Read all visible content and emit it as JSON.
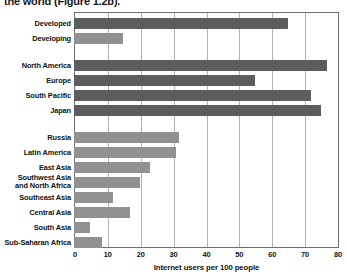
{
  "caption": {
    "text": "the world (Figure 1.2b)."
  },
  "chart_data": {
    "type": "bar",
    "orientation": "horizontal",
    "title": "",
    "subtitle": "",
    "xlabel": "Internet users per 100 people",
    "ylabel": "",
    "xlim": [
      0,
      80
    ],
    "xticks": [
      0,
      10,
      20,
      30,
      40,
      50,
      60,
      70,
      80
    ],
    "xtick_labels": [
      "0",
      "10",
      "20",
      "30",
      "40",
      "50",
      "60",
      "70",
      "80"
    ],
    "grid": "vertical",
    "legend": "none",
    "colors": {
      "developed": "#5d5d5d",
      "developing": "#919191",
      "gridline": "#b4b4b4",
      "frame": "#6d6d6d",
      "background": "#ffffff",
      "text": "#111111"
    },
    "groups": [
      {
        "name": "overall",
        "categories": [
          {
            "label": "Developed",
            "value": 65,
            "series": "developed"
          },
          {
            "label": "Developing",
            "value": 15,
            "series": "developing"
          }
        ]
      },
      {
        "name": "developed-regions",
        "categories": [
          {
            "label": "North America",
            "value": 77,
            "series": "developed"
          },
          {
            "label": "Europe",
            "value": 55,
            "series": "developed"
          },
          {
            "label": "South Pacific",
            "value": 72,
            "series": "developed"
          },
          {
            "label": "Japan",
            "value": 75,
            "series": "developed"
          }
        ]
      },
      {
        "name": "developing-regions",
        "categories": [
          {
            "label": "Russia",
            "value": 32,
            "series": "developing"
          },
          {
            "label": "Latin America",
            "value": 31,
            "series": "developing"
          },
          {
            "label": "East Asia",
            "value": 23,
            "series": "developing"
          },
          {
            "label": "Southwest Asia\nand North Africa",
            "value": 20,
            "series": "developing"
          },
          {
            "label": "Southeast Asia",
            "value": 12,
            "series": "developing"
          },
          {
            "label": "Central Asia",
            "value": 17,
            "series": "developing"
          },
          {
            "label": "South Asia",
            "value": 5,
            "series": "developing"
          },
          {
            "label": "Sub-Saharan Africa",
            "value": 8.5,
            "series": "developing"
          }
        ]
      }
    ]
  }
}
